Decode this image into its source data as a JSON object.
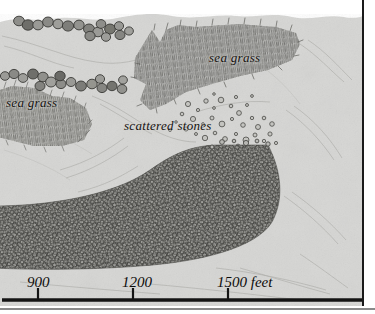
{
  "figure": {
    "kind": "archaeological-survey-seabed-map",
    "background_color": "#d6d6d4",
    "ink_color": "#14110f"
  },
  "labels": [
    {
      "id": "sea-grass-left",
      "text": "sea grass",
      "x": 6,
      "y": 95
    },
    {
      "id": "sea-grass-right",
      "text": "sea grass",
      "x": 209,
      "y": 50
    },
    {
      "id": "scattered-stones",
      "text": "scattered stones",
      "x": 124,
      "y": 118
    }
  ],
  "map_labels": {
    "sea_grass_left": "sea grass",
    "sea_grass_right": "sea grass",
    "scattered_stones": "scattered stones"
  },
  "scale_bar": {
    "unit": "feet",
    "ticks": [
      {
        "label": "900",
        "x": 38
      },
      {
        "label": "1200",
        "x": 133
      },
      {
        "label": "1500",
        "x": 228
      }
    ],
    "tick_labels": {
      "t900": "900",
      "t1200": "1200",
      "t1500": "1500 feet"
    },
    "baseline_y": 300,
    "bar_start_x": 2,
    "bar_end_x": 362,
    "interval_feet": 300,
    "interval_pixels": 95
  },
  "features": {
    "stone_wall": "dense cobble stone mass forming an L / hook shaped wall",
    "boulder_chains": 2,
    "sea_grass_patches": 2,
    "scattered_stone_field": "sparse small circular stones"
  },
  "colors": {
    "seabed": "#d6d6d4",
    "sea_grass": "#8d8d8a",
    "stone_fill": "#70706d",
    "boulder_fill": "#8a8a86",
    "scale_ink": "#141414"
  }
}
